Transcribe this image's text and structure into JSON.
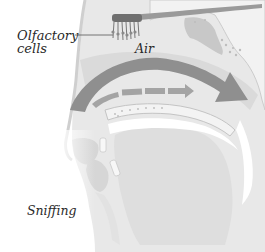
{
  "figure": {
    "labels": {
      "olfactory_line1": "Olfactory",
      "olfactory_line2": "cells",
      "air": "Air",
      "caption": "Sniffing"
    },
    "colors": {
      "background": "#ffffff",
      "tissue_light": "#e6e6e6",
      "tissue_mid": "#cfcfcf",
      "airflow_arrow": "#8f8f8f",
      "secondary_arrow": "#a4a4a4",
      "bone": "#f4f4f4",
      "olfactory_cells": "#777777",
      "text": "#2a2a2a"
    }
  }
}
